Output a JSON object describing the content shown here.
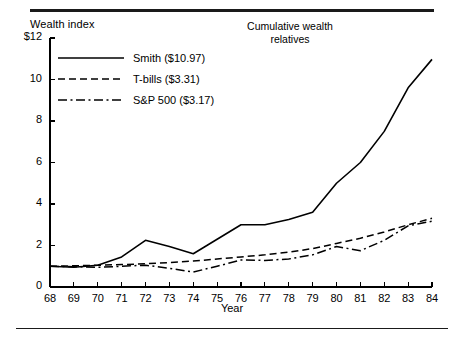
{
  "figure": {
    "title_lines": [
      "Cumulative wealth",
      "relatives"
    ],
    "y_axis_title": "Wealth index",
    "x_axis_title": "Year"
  },
  "axis": {
    "y_ticks": [
      "0",
      "2",
      "4",
      "6",
      "8",
      "10",
      "$12"
    ],
    "y_values": [
      0,
      2,
      4,
      6,
      8,
      10,
      12
    ],
    "x_ticks": [
      "68",
      "69",
      "70",
      "71",
      "72",
      "73",
      "74",
      "75",
      "76",
      "77",
      "78",
      "79",
      "80",
      "81",
      "82",
      "83",
      "84"
    ]
  },
  "legend": {
    "entries": [
      {
        "label": "Smith  ($10.97)",
        "style": "solid",
        "color": "#000000"
      },
      {
        "label": "T-bills  ($3.31)",
        "style": "dashed",
        "color": "#000000"
      },
      {
        "label": "S&P 500 ($3.17)",
        "style": "dashdot",
        "color": "#000000"
      }
    ]
  },
  "chart_data": {
    "type": "line",
    "title": "Cumulative wealth relatives",
    "xlabel": "Year",
    "ylabel": "Wealth index",
    "xlim": [
      68,
      84
    ],
    "ylim": [
      0,
      12
    ],
    "grid": false,
    "legend_position": "upper-left",
    "x": [
      68,
      69,
      70,
      71,
      72,
      73,
      74,
      75,
      76,
      77,
      78,
      79,
      80,
      81,
      82,
      83,
      84
    ],
    "series": [
      {
        "name": "Smith",
        "final_value": 10.97,
        "final_label": "$10.97",
        "style": "solid",
        "values": [
          1.0,
          0.95,
          1.05,
          1.45,
          2.25,
          1.95,
          1.6,
          2.3,
          3.0,
          3.0,
          3.25,
          3.6,
          5.0,
          6.0,
          7.5,
          9.6,
          10.97
        ]
      },
      {
        "name": "T-bills",
        "final_value": 3.31,
        "final_label": "$3.31",
        "style": "dashed",
        "values": [
          1.0,
          1.02,
          1.05,
          1.08,
          1.12,
          1.18,
          1.25,
          1.35,
          1.45,
          1.55,
          1.68,
          1.85,
          2.1,
          2.35,
          2.65,
          3.0,
          3.31
        ]
      },
      {
        "name": "S&P 500",
        "final_value": 3.17,
        "final_label": "$3.17",
        "style": "dashdot",
        "values": [
          1.0,
          0.98,
          0.95,
          1.0,
          1.05,
          0.9,
          0.72,
          1.0,
          1.3,
          1.28,
          1.35,
          1.55,
          1.95,
          1.75,
          2.25,
          2.95,
          3.17
        ]
      }
    ]
  }
}
